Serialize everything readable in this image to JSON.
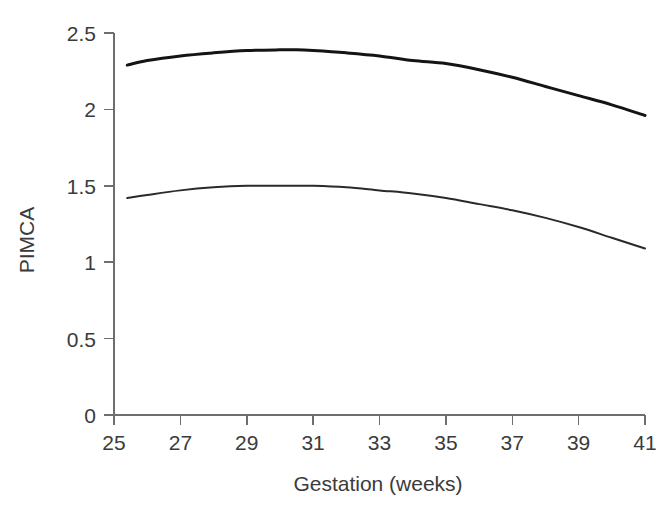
{
  "figure": {
    "background_color": "#ffffff",
    "axis_color": "#6e6e6e",
    "text_color": "#3b3b3b"
  },
  "axes": {
    "y_title": "PIMCA",
    "x_title": "Gestation (weeks)",
    "y_ticks": [
      "0",
      "0.5",
      "1",
      "1.5",
      "2",
      "2.5"
    ],
    "x_ticks": [
      "25",
      "27",
      "29",
      "31",
      "33",
      "35",
      "37",
      "39",
      "41"
    ]
  },
  "chart_data": {
    "type": "line",
    "title": "",
    "subtitle": "",
    "xlabel": "Gestation (weeks)",
    "ylabel": "PIMCA",
    "xlim": [
      25,
      41
    ],
    "ylim": [
      0,
      2.5
    ],
    "xticks": [
      25,
      27,
      29,
      31,
      33,
      35,
      37,
      39,
      41
    ],
    "yticks": [
      0,
      0.5,
      1,
      1.5,
      2,
      2.5
    ],
    "grid": false,
    "legend": "none",
    "annotations": [],
    "series": [
      {
        "name": "upper-centile-curve",
        "color": "#141414",
        "line_width": 3,
        "x": [
          25.4,
          26,
          27,
          28,
          29,
          30,
          30.5,
          31,
          32,
          33,
          34,
          35,
          36,
          37,
          38,
          39,
          40,
          41
        ],
        "values": [
          2.29,
          2.32,
          2.35,
          2.37,
          2.385,
          2.39,
          2.39,
          2.385,
          2.37,
          2.35,
          2.32,
          2.3,
          2.26,
          2.21,
          2.15,
          2.09,
          2.03,
          1.96
        ]
      },
      {
        "name": "lower-centile-curve",
        "color": "#2a2a2a",
        "line_width": 2,
        "x": [
          25.4,
          26,
          27,
          28,
          29,
          30,
          30.5,
          31,
          32,
          33,
          34,
          35,
          36,
          37,
          38,
          39,
          40,
          41
        ],
        "values": [
          1.42,
          1.44,
          1.47,
          1.49,
          1.5,
          1.5,
          1.5,
          1.5,
          1.49,
          1.47,
          1.45,
          1.42,
          1.38,
          1.34,
          1.29,
          1.23,
          1.16,
          1.09
        ]
      }
    ]
  }
}
